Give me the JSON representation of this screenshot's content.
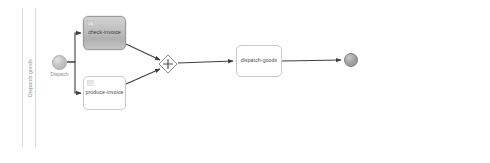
{
  "diagram": {
    "type": "bpmn-process",
    "pool": {
      "lane_label": "Dispatch goods"
    },
    "events": [
      {
        "id": "start",
        "kind": "start-event",
        "label": "Dispatch",
        "x": 52,
        "y": 55,
        "size": 15
      },
      {
        "id": "end",
        "kind": "end-event",
        "label": "",
        "x": 344,
        "y": 53,
        "size": 14
      }
    ],
    "tasks": [
      {
        "id": "check-invoice",
        "label": "check-invoice",
        "state": "selected",
        "icon": "user-task-icon",
        "x": 83,
        "y": 16,
        "width": 43,
        "height": 34
      },
      {
        "id": "produce-invoice",
        "label": "produce-invoice",
        "state": "normal",
        "icon": "user-task-icon",
        "x": 83,
        "y": 76,
        "width": 43,
        "height": 34
      },
      {
        "id": "dispatch-goods",
        "label": "dispatch-goods",
        "state": "normal",
        "icon": "",
        "x": 236,
        "y": 45,
        "width": 46,
        "height": 32
      }
    ],
    "gateways": [
      {
        "id": "join-gateway",
        "kind": "parallel-gateway",
        "symbol": "+",
        "cx": 168,
        "cy": 64,
        "half": 9
      }
    ],
    "flows": [
      {
        "id": "flow-start-check",
        "from": "start",
        "to": "check-invoice"
      },
      {
        "id": "flow-start-produce",
        "from": "start",
        "to": "produce-invoice"
      },
      {
        "id": "flow-check-join",
        "from": "check-invoice",
        "to": "join-gateway"
      },
      {
        "id": "flow-produce-join",
        "from": "produce-invoice",
        "to": "join-gateway"
      },
      {
        "id": "flow-join-dispatch",
        "from": "join-gateway",
        "to": "dispatch-goods"
      },
      {
        "id": "flow-dispatch-end",
        "from": "dispatch-goods",
        "to": "end"
      }
    ],
    "colors": {
      "frame_border": "#d4d4d4",
      "task_border": "#c9c9c9",
      "selected_task_border": "#9a9a9a",
      "flow_line": "#3f3f3f",
      "label_text": "#4a4a4a",
      "lane_text": "#8e8e8e"
    }
  }
}
